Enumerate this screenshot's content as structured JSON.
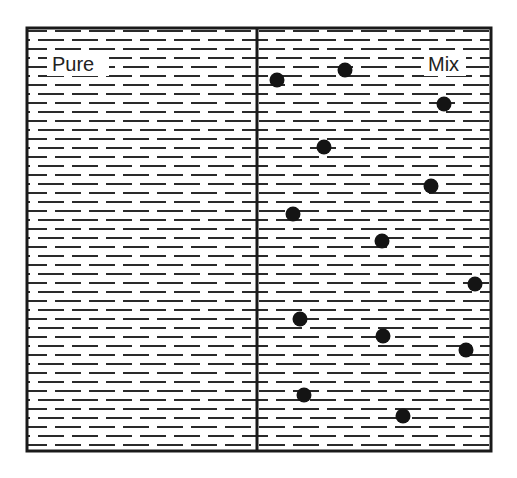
{
  "diagram": {
    "panels": [
      {
        "id": "pure",
        "label": "Pure",
        "x": 27,
        "y": 28,
        "width": 230,
        "height": 423
      },
      {
        "id": "mix",
        "label": "Mix",
        "x": 257,
        "y": 28,
        "width": 234,
        "height": 423
      }
    ],
    "colors": {
      "line": "#1a1a1a",
      "dash": "#2a2a2a",
      "dot": "#141414",
      "background": "#ffffff"
    },
    "particles": [
      {
        "x": 277,
        "y": 80
      },
      {
        "x": 345,
        "y": 70
      },
      {
        "x": 444,
        "y": 104
      },
      {
        "x": 324,
        "y": 147
      },
      {
        "x": 431,
        "y": 186
      },
      {
        "x": 293,
        "y": 214
      },
      {
        "x": 382,
        "y": 241
      },
      {
        "x": 475,
        "y": 284
      },
      {
        "x": 300,
        "y": 319
      },
      {
        "x": 383,
        "y": 336
      },
      {
        "x": 466,
        "y": 350
      },
      {
        "x": 304,
        "y": 395
      },
      {
        "x": 403,
        "y": 416
      }
    ]
  }
}
